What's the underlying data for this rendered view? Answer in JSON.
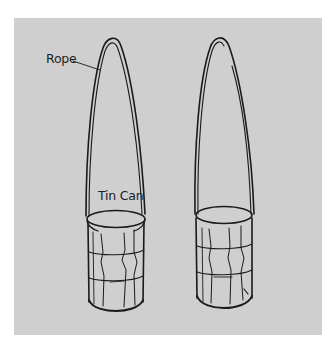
{
  "figure": {
    "background_color": "#ffffff",
    "panel_color": "#cfcfcf",
    "line_color": "#1a1a1a",
    "labels": {
      "rope": "Rope",
      "tin_can": "Tin Can"
    },
    "objects": [
      {
        "name": "left-rope-and-can",
        "labeled": true
      },
      {
        "name": "right-rope-and-can",
        "labeled": false
      }
    ]
  }
}
